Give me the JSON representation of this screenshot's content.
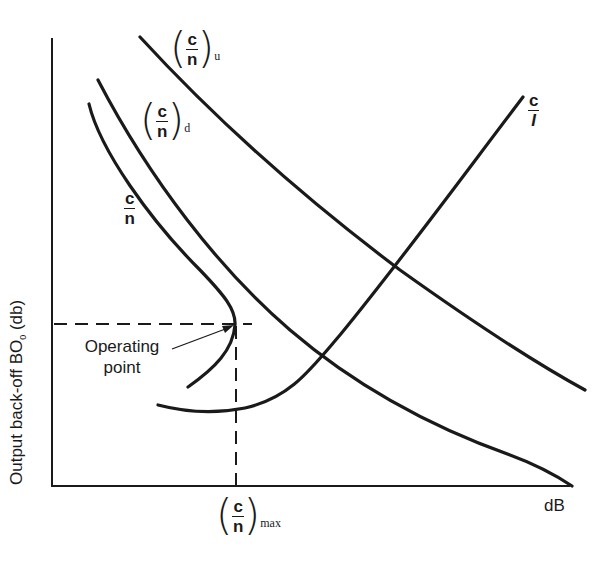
{
  "figure": {
    "y_axis_label_main": "Output back-off BO",
    "y_axis_label_sub": "0",
    "y_axis_label_unit": " (db)",
    "x_axis_label": "dB",
    "operating_point_line1": "Operating",
    "operating_point_line2": "point",
    "curves": {
      "cn_uplink": {
        "num": "c",
        "den": "n",
        "sub": "u"
      },
      "cn_downlink": {
        "num": "c",
        "den": "n",
        "sub": "d"
      },
      "cn_total": {
        "num": "c",
        "den": "n"
      },
      "ci": {
        "num": "c",
        "den": "I"
      }
    },
    "x_marker": {
      "num": "c",
      "den": "n",
      "sub": "max"
    },
    "line_color": "#1a1a1a"
  }
}
